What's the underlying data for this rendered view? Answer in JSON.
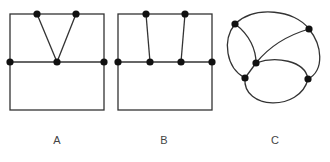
{
  "figure": {
    "graphs": [
      {
        "id": "A",
        "label": "A",
        "description": "Rectangle split by horizontal line; two top vertices both joined to one middle vertex"
      },
      {
        "id": "B",
        "label": "B",
        "description": "Rectangle split by horizontal line; two top vertices joined to two distinct middle vertices"
      },
      {
        "id": "C",
        "label": "C",
        "description": "Curved planar graph with five vertices"
      }
    ],
    "colors": {
      "edge": "#333333",
      "node": "#111111",
      "label": "#444444"
    }
  }
}
